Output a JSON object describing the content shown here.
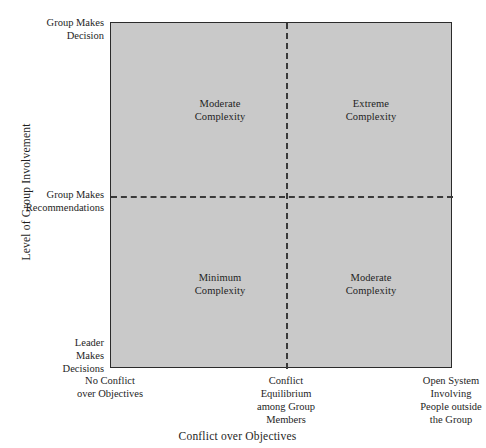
{
  "chart_data": {
    "type": "table",
    "title": "",
    "xlabel": "Conflict over Objectives",
    "ylabel": "Level of Group Involvement",
    "grid": false,
    "legend": "none",
    "x_axis": {
      "label": "Conflict over Objectives",
      "ticks": [
        "No Conflict\nover Objectives",
        "Conflict\nEquilibrium\namong Group\nMembers",
        "Open System\nInvolving\nPeople outside\nthe Group"
      ]
    },
    "y_axis": {
      "label": "Level of Group Involvement",
      "ticks": [
        "Group Makes\nDecision",
        "Group Makes\nRecommendations",
        "Leader\nMakes\nDecisions"
      ]
    },
    "quadrants": [
      {
        "position": "top-left",
        "label": "Moderate\nComplexity",
        "x_band": "No Conflict over Objectives",
        "y_band": "Group Makes Decision"
      },
      {
        "position": "top-right",
        "label": "Extreme\nComplexity",
        "x_band": "Open System Involving People outside the Group",
        "y_band": "Group Makes Decision"
      },
      {
        "position": "bottom-left",
        "label": "Minimum\nComplexity",
        "x_band": "No Conflict over Objectives",
        "y_band": "Leader Makes Decisions"
      },
      {
        "position": "bottom-right",
        "label": "Moderate\nComplexity",
        "x_band": "Open System Involving People outside the Group",
        "y_band": "Leader Makes Decisions"
      }
    ],
    "colors": {
      "plot_background": "#c9c9c9",
      "axis_line": "#2b2b2b",
      "divider_line": "#3a3a3a",
      "text": "#1e1e1e",
      "page_background": "#ffffff"
    }
  },
  "labels": {
    "y_top": "Group Makes\nDecision",
    "y_mid": "Group Makes\nRecommendations",
    "y_bottom": "Leader\nMakes\nDecisions",
    "x_left": "No Conflict\nover Objectives",
    "x_mid": "Conflict\nEquilibrium\namong Group\nMembers",
    "x_right": "Open System\nInvolving\nPeople outside\nthe Group",
    "y_title": "Level of Group Involvement",
    "x_title": "Conflict over Objectives",
    "quad_top_left": "Moderate\nComplexity",
    "quad_top_right": "Extreme\nComplexity",
    "quad_bottom_left": "Minimum\nComplexity",
    "quad_bottom_right": "Moderate\nComplexity"
  }
}
